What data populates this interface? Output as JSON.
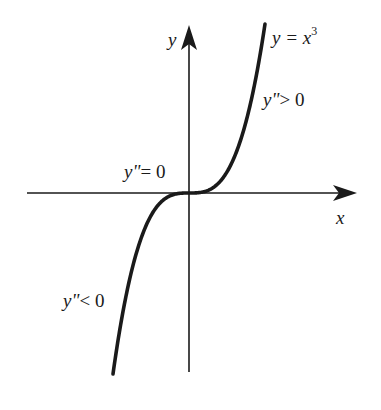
{
  "diagram": {
    "axes": {
      "x_label": "x",
      "y_label": "y"
    },
    "curve": {
      "label_prefix": "y = x",
      "label_exponent": "3",
      "function": "y = x^3"
    },
    "annotations": {
      "upper": "y\">0",
      "upper_var": "y\"",
      "upper_rel": "> 0",
      "inflection_var": "y\"",
      "inflection_rel": "= 0",
      "lower_var": "y\"",
      "lower_rel": "< 0"
    },
    "colors": {
      "ink": "#1a1a1a",
      "background": "#ffffff"
    }
  }
}
